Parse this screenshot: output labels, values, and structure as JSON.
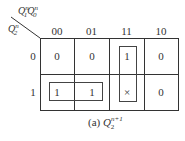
{
  "kmap": {
    "row_variable": "Q2n",
    "column_variables": "Q1nQ0n",
    "column_headers": [
      "00",
      "01",
      "11",
      "10"
    ],
    "row_headers": [
      "0",
      "1"
    ],
    "cells": [
      [
        "0",
        "0",
        "1",
        "0"
      ],
      [
        "1",
        "1",
        "×",
        "0"
      ]
    ],
    "loops": [
      {
        "cells": [
          [
            1,
            0
          ],
          [
            1,
            1
          ]
        ],
        "description": "row 1, columns 00-01"
      },
      {
        "cells": [
          [
            0,
            2
          ],
          [
            1,
            2
          ]
        ],
        "description": "column 11, rows 0-1"
      }
    ],
    "caption_prefix": "(a) ",
    "caption_var": "Q",
    "caption_sub": "2",
    "caption_sup": "n+1"
  }
}
